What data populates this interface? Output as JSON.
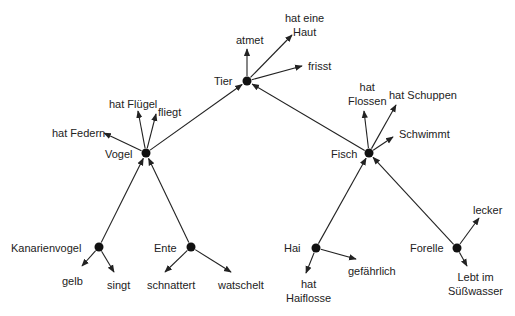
{
  "colors": {
    "line": "#222222",
    "node": "#111111",
    "text": "#222222"
  },
  "nodes": [
    {
      "id": "tier",
      "label": "Tier",
      "x": 247,
      "y": 81
    },
    {
      "id": "vogel",
      "label": "Vogel",
      "x": 146,
      "y": 153
    },
    {
      "id": "fisch",
      "label": "Fisch",
      "x": 369,
      "y": 153
    },
    {
      "id": "kanarienvogel",
      "label": "Kanarienvogel",
      "x": 99,
      "y": 247
    },
    {
      "id": "ente",
      "label": "Ente",
      "x": 191,
      "y": 247
    },
    {
      "id": "hai",
      "label": "Hai",
      "x": 316,
      "y": 248
    },
    {
      "id": "forelle",
      "label": "Forelle",
      "x": 457,
      "y": 248
    }
  ],
  "labels": {
    "tier": "Tier",
    "vogel": "Vogel",
    "fisch": "Fisch",
    "kanarienvogel": "Kanarienvogel",
    "ente": "Ente",
    "hai": "Hai",
    "forelle": "Forelle",
    "atmet": "atmet",
    "hat_eine_haut_1": "hat eine",
    "hat_eine_haut_2": "Haut",
    "frisst": "frisst",
    "hat_fluegel": "hat Flügel",
    "fliegt": "fliegt",
    "hat_federn": "hat Federn",
    "hat_flossen_1": "hat",
    "hat_flossen_2": "Flossen",
    "hat_schuppen": "hat Schuppen",
    "schwimmt": "Schwimmt",
    "gelb": "gelb",
    "singt": "singt",
    "schnattert": "schnattert",
    "watschelt": "watschelt",
    "hat_haiflosse_1": "hat",
    "hat_haiflosse_2": "Haiflosse",
    "gefaehrlich": "gefährlich",
    "lecker": "lecker",
    "lebt_1": "Lebt im",
    "lebt_2": "Süßwasser"
  },
  "edges": [
    {
      "from": [
        146,
        153
      ],
      "to": [
        247,
        81
      ],
      "type": "isa"
    },
    {
      "from": [
        369,
        153
      ],
      "to": [
        247,
        81
      ],
      "type": "isa"
    },
    {
      "from": [
        99,
        247
      ],
      "to": [
        146,
        153
      ],
      "type": "isa"
    },
    {
      "from": [
        191,
        247
      ],
      "to": [
        146,
        153
      ],
      "type": "isa"
    },
    {
      "from": [
        316,
        248
      ],
      "to": [
        369,
        153
      ],
      "type": "isa"
    },
    {
      "from": [
        457,
        248
      ],
      "to": [
        369,
        153
      ],
      "type": "isa"
    },
    {
      "from": [
        247,
        81
      ],
      "to": [
        247,
        49
      ],
      "type": "prop",
      "name": "atmet"
    },
    {
      "from": [
        247,
        81
      ],
      "to": [
        292,
        35
      ],
      "type": "prop",
      "name": "hat eine Haut"
    },
    {
      "from": [
        247,
        81
      ],
      "to": [
        302,
        66
      ],
      "type": "prop",
      "name": "frisst"
    },
    {
      "from": [
        146,
        153
      ],
      "to": [
        138,
        111
      ],
      "type": "prop",
      "name": "hat Flügel"
    },
    {
      "from": [
        146,
        153
      ],
      "to": [
        156,
        114
      ],
      "type": "prop",
      "name": "fliegt"
    },
    {
      "from": [
        146,
        153
      ],
      "to": [
        104,
        133
      ],
      "type": "prop",
      "name": "hat Federn"
    },
    {
      "from": [
        369,
        153
      ],
      "to": [
        364,
        111
      ],
      "type": "prop",
      "name": "hat Flossen"
    },
    {
      "from": [
        369,
        153
      ],
      "to": [
        396,
        105
      ],
      "type": "prop",
      "name": "hat Schuppen"
    },
    {
      "from": [
        369,
        153
      ],
      "to": [
        393,
        137
      ],
      "type": "prop",
      "name": "Schwimmt"
    },
    {
      "from": [
        99,
        247
      ],
      "to": [
        82,
        266
      ],
      "type": "prop",
      "name": "gelb"
    },
    {
      "from": [
        99,
        247
      ],
      "to": [
        114,
        272
      ],
      "type": "prop",
      "name": "singt"
    },
    {
      "from": [
        191,
        247
      ],
      "to": [
        165,
        272
      ],
      "type": "prop",
      "name": "schnattert"
    },
    {
      "from": [
        191,
        247
      ],
      "to": [
        231,
        272
      ],
      "type": "prop",
      "name": "watschelt"
    },
    {
      "from": [
        316,
        248
      ],
      "to": [
        306,
        273
      ],
      "type": "prop",
      "name": "hat Haiflosse"
    },
    {
      "from": [
        316,
        248
      ],
      "to": [
        356,
        259
      ],
      "type": "prop",
      "name": "gefährlich"
    },
    {
      "from": [
        457,
        248
      ],
      "to": [
        479,
        218
      ],
      "type": "prop",
      "name": "lecker"
    },
    {
      "from": [
        457,
        248
      ],
      "to": [
        467,
        266
      ],
      "type": "prop",
      "name": "Lebt im Süßwasser"
    }
  ]
}
